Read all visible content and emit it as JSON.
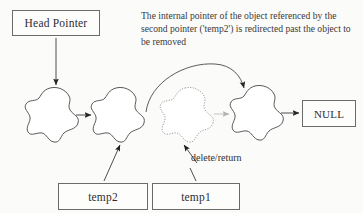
{
  "figure": {
    "kind": "linked-list-node-removal-diagram",
    "background_color": "#fbfbfa",
    "ink_color": "#4a4a4a",
    "text_color": "#2e2e2e",
    "faded_ink_color": "#a9a9a9"
  },
  "caption": {
    "text": "The internal pointer of the object referenced by the second pointer ('temp2') is redirected past the object to be removed"
  },
  "boxes": {
    "head_pointer": "Head Pointer",
    "null_terminator": "NULL",
    "temp2": "temp2",
    "temp1": "temp1"
  },
  "labels": {
    "delete_return": "delete/return"
  },
  "nodes": [
    {
      "name": "node-1",
      "style": "solid",
      "cx": 51,
      "cy": 114
    },
    {
      "name": "node-2",
      "style": "solid",
      "cx": 117,
      "cy": 114
    },
    {
      "name": "node-3",
      "style": "dotted",
      "cx": 186,
      "cy": 114
    },
    {
      "name": "node-4",
      "style": "solid",
      "cx": 256,
      "cy": 112
    }
  ],
  "arrows": [
    {
      "name": "head-pointer-to-node-1",
      "style": "solid"
    },
    {
      "name": "node-1-to-node-2",
      "style": "solid"
    },
    {
      "name": "node-3-to-node-4",
      "style": "faded"
    },
    {
      "name": "node-4-to-null",
      "style": "solid"
    },
    {
      "name": "node-2-redirect-to-node-4",
      "style": "curved"
    },
    {
      "name": "temp2-to-node-2",
      "style": "solid"
    },
    {
      "name": "temp1-to-node-3",
      "style": "solid"
    },
    {
      "name": "delete-return-to-node-3",
      "style": "solid"
    }
  ]
}
